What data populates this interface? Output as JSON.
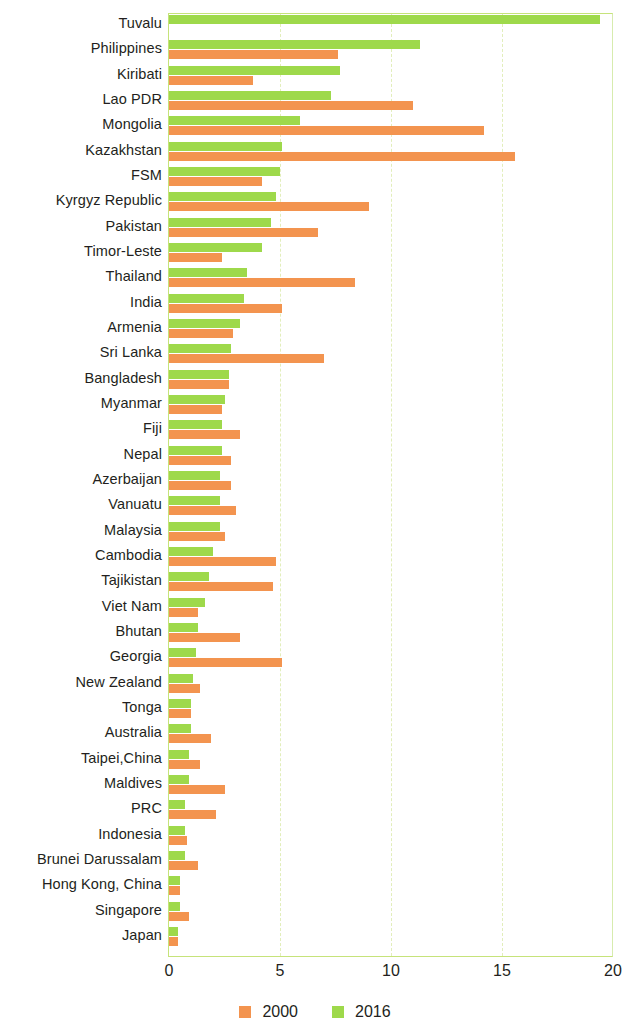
{
  "chart_data": {
    "type": "bar",
    "orientation": "horizontal",
    "title": "",
    "subtitle": "",
    "xlabel": "",
    "ylabel": "",
    "xlim": [
      0,
      20
    ],
    "xticks": [
      0,
      5,
      10,
      15,
      20
    ],
    "xtick_labels": [
      "0",
      "5",
      "10",
      "15",
      "20"
    ],
    "grid": "vertical dashed gridlines at 5, 10, 15",
    "legend_position": "bottom-center",
    "colors": {
      "series_2000": "#f3944f",
      "series_2016": "#9ed94b",
      "axis": "#c6e37a",
      "gridline": "#e2eebb",
      "text": "#231f20"
    },
    "categories": [
      "Tuvalu",
      "Philippines",
      "Kiribati",
      "Lao PDR",
      "Mongolia",
      "Kazakhstan",
      "FSM",
      "Kyrgyz Republic",
      "Pakistan",
      "Timor-Leste",
      "Thailand",
      "India",
      "Armenia",
      "Sri Lanka",
      "Bangladesh",
      "Myanmar",
      "Fiji",
      "Nepal",
      "Azerbaijan",
      "Vanuatu",
      "Malaysia",
      "Cambodia",
      "Tajikistan",
      "Viet Nam",
      "Bhutan",
      "Georgia",
      "New Zealand",
      "Tonga",
      "Australia",
      "Taipei,China",
      "Maldives",
      "PRC",
      "Indonesia",
      "Brunei Darussalam",
      "Hong Kong, China",
      "Singapore",
      "Japan"
    ],
    "series": [
      {
        "name": "2000",
        "color": "#f3944f",
        "values": [
          0.0,
          7.6,
          3.8,
          11.0,
          14.2,
          15.6,
          4.2,
          9.0,
          6.7,
          2.4,
          8.4,
          5.1,
          2.9,
          7.0,
          2.7,
          2.4,
          3.2,
          2.8,
          2.8,
          3.0,
          2.5,
          4.8,
          4.7,
          1.3,
          3.2,
          5.1,
          1.4,
          1.0,
          1.9,
          1.4,
          2.5,
          2.1,
          0.8,
          1.3,
          0.5,
          0.9,
          0.4
        ]
      },
      {
        "name": "2016",
        "color": "#9ed94b",
        "values": [
          19.4,
          11.3,
          7.7,
          7.3,
          5.9,
          5.1,
          5.0,
          4.8,
          4.6,
          4.2,
          3.5,
          3.4,
          3.2,
          2.8,
          2.7,
          2.5,
          2.4,
          2.4,
          2.3,
          2.3,
          2.3,
          2.0,
          1.8,
          1.6,
          1.3,
          1.2,
          1.1,
          1.0,
          1.0,
          0.9,
          0.9,
          0.7,
          0.7,
          0.7,
          0.5,
          0.5,
          0.4
        ]
      }
    ]
  },
  "legend": {
    "items": [
      {
        "label": "2000",
        "color": "#f3944f",
        "swatch_name": "legend-swatch-2000"
      },
      {
        "label": "2016",
        "color": "#9ed94b",
        "swatch_name": "legend-swatch-2016"
      }
    ]
  }
}
